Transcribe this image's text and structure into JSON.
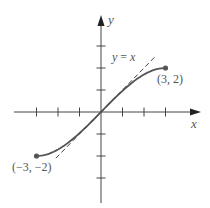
{
  "chart_data": {
    "type": "line",
    "title": "",
    "xlabel": "x",
    "ylabel": "y",
    "xlim": [
      -4,
      4.5
    ],
    "ylim": [
      -4,
      4.3
    ],
    "xticks": [
      -3,
      -2,
      -1,
      1,
      2,
      3
    ],
    "yticks": [
      -3,
      -2,
      -1,
      1,
      2,
      3
    ],
    "grid": false,
    "legend": "none",
    "series": [
      {
        "name": "curve",
        "style": "solid",
        "color": "#555555",
        "x": [
          -3,
          -2.5,
          -2,
          -1.5,
          -1,
          -0.5,
          0,
          0.5,
          1,
          1.5,
          2,
          2.5,
          3
        ],
        "y": [
          -2,
          -1.92,
          -1.7,
          -1.38,
          -0.96,
          -0.5,
          0,
          0.5,
          0.96,
          1.38,
          1.7,
          1.92,
          2
        ],
        "endpoints": [
          {
            "x": -3,
            "y": -2,
            "label": "(−3, −2)"
          },
          {
            "x": 3,
            "y": 2,
            "label": "(3, 2)"
          }
        ]
      },
      {
        "name": "y = x",
        "style": "dashed",
        "color": "#444444",
        "x": [
          -2.1,
          2.5
        ],
        "y": [
          -2.1,
          2.5
        ]
      }
    ],
    "annotations": [
      {
        "text": "y = x",
        "x": 0.55,
        "y": 2.6
      },
      {
        "text": "(3, 2)",
        "x": 2.6,
        "y": 1.3
      },
      {
        "text": "(−3, −2)",
        "x": -4.0,
        "y": -2.65
      }
    ]
  },
  "labels": {
    "x_axis": "x",
    "y_axis": "y",
    "line_label": "y = x",
    "point_right": "(3, 2)",
    "point_left": "(−3, −2)"
  }
}
